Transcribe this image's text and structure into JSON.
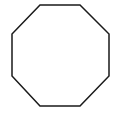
{
  "diagram": {
    "shape": "octagon",
    "label": "Octagon",
    "stroke_color": "#1a1a1a",
    "fill_color": "#ffffff",
    "stroke_width": 1.5,
    "vertices": [
      [
        40,
        5
      ],
      [
        80,
        5
      ],
      [
        109,
        34
      ],
      [
        109,
        76
      ],
      [
        80,
        106
      ],
      [
        40,
        106
      ],
      [
        12,
        76
      ],
      [
        12,
        34
      ]
    ]
  }
}
